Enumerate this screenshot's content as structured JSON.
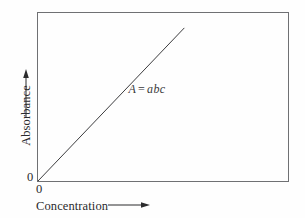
{
  "figure": {
    "background_color": "#fefefe",
    "frame_color": "#6f7073",
    "ink_color": "#2b2b2d"
  },
  "axes": {
    "y": {
      "label": "Absorbance",
      "origin_label": "0",
      "arrow": "up-arrow-icon"
    },
    "x": {
      "label": "Concentration",
      "origin_label": "0",
      "arrow": "right-arrow-icon"
    }
  },
  "annotation": {
    "equation_lhs": "A",
    "equation_op": "=",
    "equation_rhs": "abc",
    "equation_full": "A = abc"
  },
  "chart_data": {
    "type": "line",
    "title": "",
    "subtitle": "",
    "xlabel": "Concentration",
    "ylabel": "Absorbance",
    "xlim": [
      0,
      1
    ],
    "ylim": [
      0,
      1
    ],
    "grid": false,
    "legend": false,
    "xticks": [
      0
    ],
    "xticklabels": [
      "0"
    ],
    "yticks": [
      0
    ],
    "yticklabels": [
      "0"
    ],
    "annotations": [
      {
        "text": "A = abc",
        "x": 0.36,
        "y": 0.55,
        "style": "italic"
      }
    ],
    "series": [
      {
        "name": "Beer's law calibration line",
        "relationship": "A = abc",
        "x": [
          0.0,
          0.583
        ],
        "y": [
          0.0,
          0.906
        ],
        "slope": 1.554,
        "intercept": 0.0,
        "line_color": "#3c3c3e",
        "line_width": 1
      }
    ]
  }
}
